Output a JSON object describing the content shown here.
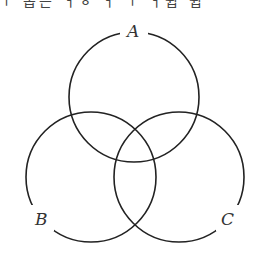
{
  "header": {
    "clipped_text": "ㅜ 옵은 ㅓㅎ ㅓ ㅜ ㅓ쉽 쉽"
  },
  "diagram": {
    "type": "venn",
    "sets": [
      {
        "label": "A",
        "cx": 134,
        "cy": 97,
        "r": 65
      },
      {
        "label": "B",
        "cx": 91,
        "cy": 177,
        "r": 65
      },
      {
        "label": "C",
        "cx": 179,
        "cy": 177,
        "r": 65
      }
    ],
    "stroke_color": "#222222"
  }
}
